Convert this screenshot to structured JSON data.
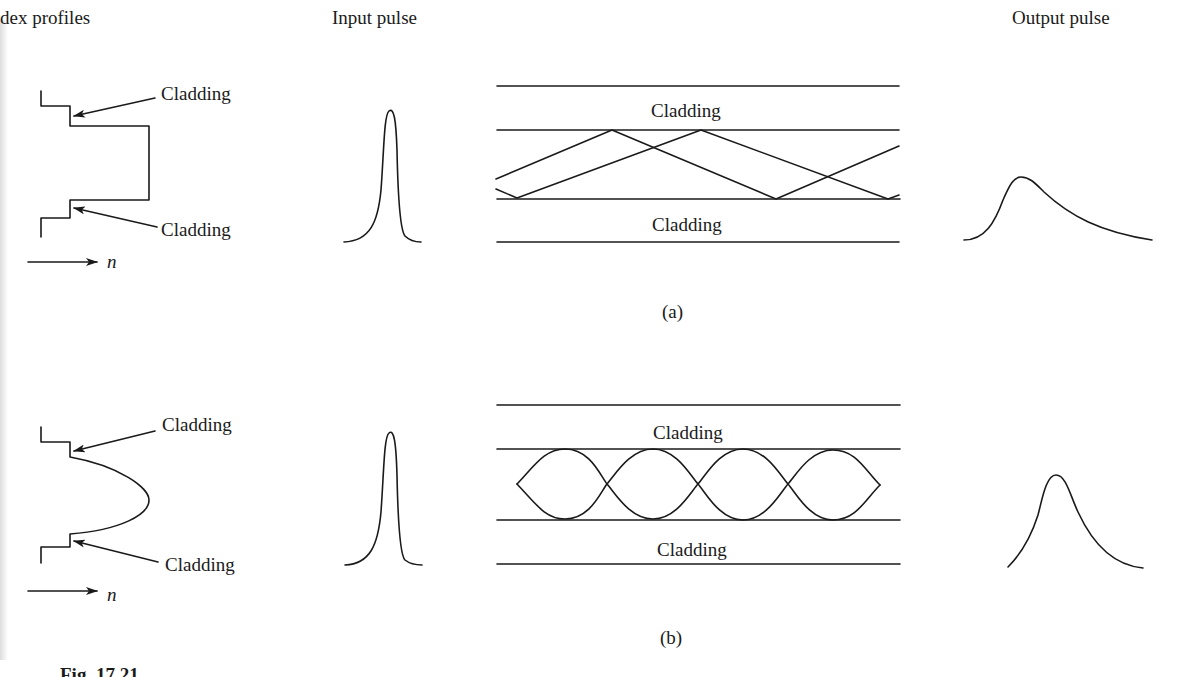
{
  "headers": {
    "index_profiles": "dex profiles",
    "input_pulse": "Input pulse",
    "output_pulse": "Output pulse"
  },
  "panel_a": {
    "label": "(a)",
    "profile_type": "step-index",
    "profile_labels": {
      "top": "Cladding",
      "bottom": "Cladding"
    },
    "axis_label": "n",
    "fiber_labels": {
      "top": "Cladding",
      "bottom": "Cladding"
    },
    "ray_type": "zig-zag"
  },
  "panel_b": {
    "label": "(b)",
    "profile_type": "graded-index",
    "profile_labels": {
      "top": "Cladding",
      "bottom": "Cladding"
    },
    "axis_label": "n",
    "fiber_labels": {
      "top": "Cladding",
      "bottom": "Cladding"
    },
    "ray_type": "sinusoidal"
  },
  "caption": "Fig. 17.21",
  "colors": {
    "ink": "#1a1a1a",
    "background": "#ffffff"
  }
}
